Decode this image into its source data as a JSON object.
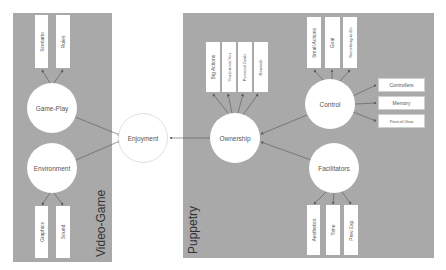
{
  "panels": {
    "video_game": {
      "label": "Video-Game"
    },
    "puppetry": {
      "label": "Puppetry"
    }
  },
  "nodes": {
    "enjoyment": "Enjoyment",
    "game_play": "Game-Play",
    "environment": "Environment",
    "ownership": "Ownership",
    "control": "Control",
    "facilitators": "Facilitators"
  },
  "leaves": {
    "game_play": [
      "Scenario",
      "Rules"
    ],
    "environment": [
      "Graphics",
      "Sound"
    ],
    "ownership": [
      "Big Actions",
      "You-but-not-You",
      "Personal Goals",
      "Rewards"
    ],
    "control_top": [
      "Small Actions",
      "Goal",
      "Something-to-Do"
    ],
    "control_right": [
      "Controllers",
      "Memory",
      "Point-of-View"
    ],
    "facilitators": [
      "Aesthetics",
      "Time",
      "Prev.Exp."
    ]
  },
  "colors": {
    "panel": "#a9a9a9",
    "node": "#ffffff",
    "edge": "#555555"
  }
}
